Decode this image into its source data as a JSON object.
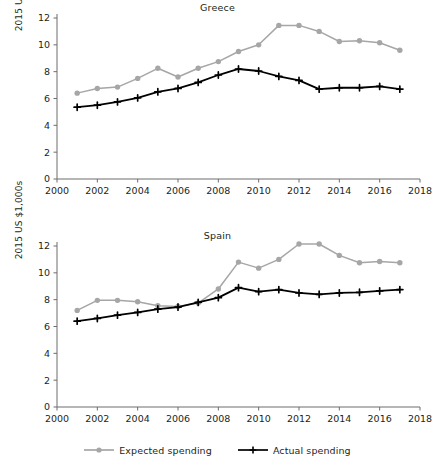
{
  "figure": {
    "ylabel": "2015 US $1,000s",
    "colors": {
      "expected": "#a6a6a6",
      "actual": "#000000",
      "axis": "#6d6d6d",
      "text": "#231f20"
    }
  },
  "legend": {
    "position": "bottom-center",
    "entries": [
      {
        "label": "Expected spending",
        "color": "#a6a6a6",
        "marker": "circle"
      },
      {
        "label": "Actual spending",
        "color": "#000000",
        "marker": "plus"
      }
    ]
  },
  "chart_data": [
    {
      "type": "line",
      "title": "Greece",
      "xlabel": "",
      "ylabel": "2015 US $1,000s",
      "xlim": [
        2000,
        2018
      ],
      "ylim": [
        0,
        12
      ],
      "xticks": [
        2000,
        2002,
        2004,
        2006,
        2008,
        2010,
        2012,
        2014,
        2016,
        2018
      ],
      "yticks": [
        0,
        2,
        4,
        6,
        8,
        10,
        12
      ],
      "grid": false,
      "x": [
        2001,
        2002,
        2003,
        2004,
        2005,
        2006,
        2007,
        2008,
        2009,
        2010,
        2011,
        2012,
        2013,
        2014,
        2015,
        2016,
        2017
      ],
      "series": [
        {
          "name": "Expected spending",
          "color": "#a6a6a6",
          "marker": "circle",
          "values": [
            6.4,
            6.75,
            6.85,
            7.5,
            8.25,
            7.6,
            8.25,
            8.75,
            9.5,
            10.0,
            11.45,
            11.45,
            11.0,
            10.25,
            10.3,
            10.15,
            9.6
          ]
        },
        {
          "name": "Actual spending",
          "color": "#000000",
          "marker": "plus",
          "values": [
            5.35,
            5.5,
            5.75,
            6.05,
            6.5,
            6.75,
            7.2,
            7.75,
            8.2,
            8.05,
            7.65,
            7.35,
            6.7,
            6.8,
            6.8,
            6.9,
            6.7
          ]
        }
      ]
    },
    {
      "type": "line",
      "title": "Spain",
      "xlabel": "",
      "ylabel": "2015 US $1,000s",
      "xlim": [
        2000,
        2018
      ],
      "ylim": [
        0,
        12
      ],
      "xticks": [
        2000,
        2002,
        2004,
        2006,
        2008,
        2010,
        2012,
        2014,
        2016,
        2018
      ],
      "yticks": [
        0,
        2,
        4,
        6,
        8,
        10,
        12
      ],
      "grid": false,
      "x": [
        2001,
        2002,
        2003,
        2004,
        2005,
        2006,
        2007,
        2008,
        2009,
        2010,
        2011,
        2012,
        2013,
        2014,
        2015,
        2016,
        2017
      ],
      "series": [
        {
          "name": "Expected spending",
          "color": "#a6a6a6",
          "marker": "circle",
          "values": [
            7.2,
            7.95,
            7.95,
            7.85,
            7.55,
            7.5,
            7.75,
            8.8,
            10.8,
            10.35,
            11.0,
            12.15,
            12.15,
            11.3,
            10.75,
            10.85,
            10.75
          ]
        },
        {
          "name": "Actual spending",
          "color": "#000000",
          "marker": "plus",
          "values": [
            6.4,
            6.6,
            6.85,
            7.05,
            7.3,
            7.45,
            7.8,
            8.15,
            8.9,
            8.6,
            8.75,
            8.5,
            8.4,
            8.5,
            8.55,
            8.65,
            8.75
          ]
        }
      ]
    }
  ]
}
